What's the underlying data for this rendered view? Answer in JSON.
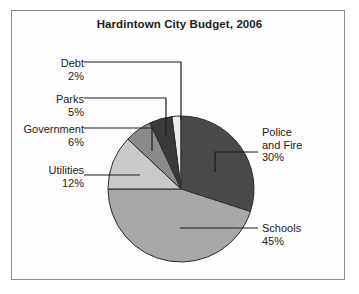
{
  "chart_data": {
    "type": "pie",
    "title": "Hardintown City Budget, 2006",
    "xlabel": "",
    "ylabel": "",
    "legend": "none",
    "grid": false,
    "categories": [
      "Police and Fire",
      "Schools",
      "Utilities",
      "Government",
      "Parks",
      "Debt"
    ],
    "values": [
      30,
      45,
      12,
      6,
      5,
      2
    ],
    "unit": "%",
    "colors": [
      "#4a4a4a",
      "#a8a8a8",
      "#c9c9c9",
      "#8a8a8a",
      "#3a3a3a",
      "#ededed"
    ],
    "slices": [
      {
        "name": "Police and Fire",
        "value": 30,
        "label": "Police",
        "label2": "and Fire",
        "pct": "30%",
        "color": "#4a4a4a"
      },
      {
        "name": "Schools",
        "value": 45,
        "label": "Schools",
        "pct": "45%",
        "color": "#a8a8a8"
      },
      {
        "name": "Utilities",
        "value": 12,
        "label": "Utilities",
        "pct": "12%",
        "color": "#c9c9c9"
      },
      {
        "name": "Government",
        "value": 6,
        "label": "Government",
        "pct": "6%",
        "color": "#8a8a8a"
      },
      {
        "name": "Parks",
        "value": 5,
        "label": "Parks",
        "pct": "5%",
        "color": "#3a3a3a"
      },
      {
        "name": "Debt",
        "value": 2,
        "label": "Debt",
        "pct": "2%",
        "color": "#ededed"
      }
    ]
  },
  "chart": {
    "title": "Hardintown City Budget, 2006"
  },
  "labels": {
    "debt": {
      "name": "Debt",
      "pct": "2%"
    },
    "parks": {
      "name": "Parks",
      "pct": "5%"
    },
    "government": {
      "name": "Government",
      "pct": "6%"
    },
    "utilities": {
      "name": "Utilities",
      "pct": "12%"
    },
    "police": {
      "name": "Police",
      "name2": "and Fire",
      "pct": "30%"
    },
    "schools": {
      "name": "Schools",
      "pct": "45%"
    }
  }
}
